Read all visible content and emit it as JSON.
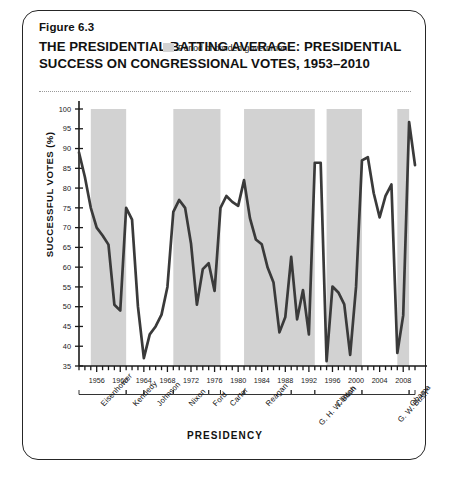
{
  "figure": {
    "number": "Figure 6.3",
    "title": "THE PRESIDENTIAL BATTING AVERAGE: PRESIDENTIAL SUCCESS ON CONGRESSIONAL VOTES, 1953–2010"
  },
  "legend": {
    "label": "Period of divided government",
    "swatch_color": "#d2d2d2"
  },
  "colors": {
    "line": "#3a3a3a",
    "shade": "#d2d2d2",
    "axis": "#1a1a1a",
    "frame": "#262626"
  },
  "chart_data": {
    "type": "line",
    "title": "THE PRESIDENTIAL BATTING AVERAGE: PRESIDENTIAL SUCCESS ON CONGRESSIONAL VOTES, 1953–2010",
    "xlabel": "PRESIDENCY",
    "ylabel": "SUCCESSFUL VOTES (%)",
    "ylim": [
      35,
      100
    ],
    "xlim": [
      1953,
      2010
    ],
    "ytick_step": 5,
    "yticks": [
      35,
      40,
      45,
      50,
      55,
      60,
      65,
      70,
      75,
      80,
      85,
      90,
      95,
      100
    ],
    "xticks": [
      1956,
      1960,
      1964,
      1968,
      1972,
      1976,
      1980,
      1984,
      1988,
      1992,
      1996,
      2000,
      2004,
      2008
    ],
    "xtick_every": 1,
    "grid": false,
    "legend_position": "top-center",
    "x": [
      1953,
      1954,
      1955,
      1956,
      1957,
      1958,
      1959,
      1960,
      1961,
      1962,
      1963,
      1964,
      1965,
      1966,
      1967,
      1968,
      1969,
      1970,
      1971,
      1972,
      1973,
      1974,
      1975,
      1976,
      1977,
      1978,
      1979,
      1980,
      1981,
      1982,
      1983,
      1984,
      1985,
      1986,
      1987,
      1988,
      1989,
      1990,
      1991,
      1992,
      1993,
      1994,
      1995,
      1996,
      1997,
      1998,
      1999,
      2000,
      2001,
      2002,
      2003,
      2004,
      2005,
      2006,
      2007,
      2008,
      2009,
      2010
    ],
    "values": [
      89.0,
      82.8,
      75.0,
      70.0,
      68.0,
      65.7,
      50.5,
      49.0,
      75.0,
      72.0,
      50.0,
      37.0,
      43.0,
      45.0,
      48.0,
      55.0,
      74.0,
      77.0,
      75.0,
      66.0,
      50.5,
      59.5,
      61.0,
      54.0,
      75.0,
      78.0,
      76.5,
      75.5,
      82.0,
      72.4,
      67.0,
      65.8,
      59.9,
      56.1,
      43.5,
      47.4,
      62.6,
      46.8,
      54.2,
      43.0,
      86.4,
      86.4,
      36.2,
      55.1,
      53.6,
      50.6,
      37.8,
      55.0,
      87.0,
      87.8,
      78.7,
      72.6,
      78.0,
      80.9,
      38.3,
      47.8,
      96.7,
      85.8
    ],
    "divided_government_periods": [
      {
        "start": 1955,
        "end": 1961
      },
      {
        "start": 1969,
        "end": 1977
      },
      {
        "start": 1981,
        "end": 1993
      },
      {
        "start": 1995,
        "end": 2001
      },
      {
        "start": 2007,
        "end": 2009
      }
    ],
    "presidencies": [
      {
        "name": "Eisenhower",
        "start": 1953,
        "end": 1961
      },
      {
        "name": "Kennedy",
        "start": 1961,
        "end": 1964
      },
      {
        "name": "Johnson",
        "start": 1964,
        "end": 1969
      },
      {
        "name": "Nixon",
        "start": 1969,
        "end": 1975
      },
      {
        "name": "Ford",
        "start": 1975,
        "end": 1977
      },
      {
        "name": "Carter",
        "start": 1977,
        "end": 1981
      },
      {
        "name": "Reagan",
        "start": 1981,
        "end": 1989
      },
      {
        "name": "G. H. W. Bush",
        "start": 1989,
        "end": 1993
      },
      {
        "name": "Clinton",
        "start": 1993,
        "end": 2001
      },
      {
        "name": "G. W. Bush*",
        "start": 2001,
        "end": 2009
      },
      {
        "name": "Obama",
        "start": 2009,
        "end": 2011
      }
    ],
    "presidency_label_order": [
      "Eisenhower",
      "Kennedy",
      "Johnson",
      "Nixon",
      "Ford",
      "Carter",
      "G. H. W. Bush",
      "Reagan",
      "Clinton",
      "G. W. Bush*",
      "Obama"
    ]
  }
}
